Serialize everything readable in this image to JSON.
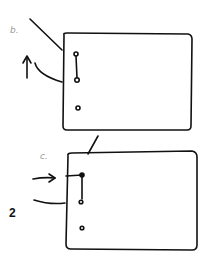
{
  "diagram": {
    "style": "hand-drawn sketch",
    "step_number": "2",
    "stroke_color": "#111111",
    "label_color": "#9a9a9a",
    "panels": [
      {
        "id": "b",
        "label": "b.",
        "elements": [
          "rectangle",
          "diagonal-line",
          "curved-line",
          "up-arrow",
          "three-small-circles",
          "connector-line-between-top-two-circles"
        ]
      },
      {
        "id": "c",
        "label": "c.",
        "elements": [
          "rectangle",
          "diagonal-line-top",
          "right-arrow",
          "curved-line",
          "filled-dot",
          "bent-connector",
          "two-small-circles"
        ]
      }
    ]
  }
}
